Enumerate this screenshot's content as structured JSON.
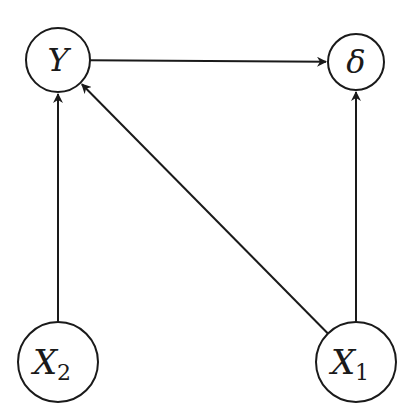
{
  "diagram": {
    "type": "directed-graph",
    "nodes": [
      {
        "id": "Y",
        "label": "Y",
        "subscript": "",
        "cx": 58,
        "cy": 60,
        "r": 32
      },
      {
        "id": "delta",
        "label": "δ",
        "subscript": "",
        "cx": 356,
        "cy": 62,
        "r": 28
      },
      {
        "id": "X2",
        "label": "X",
        "subscript": "2",
        "cx": 58,
        "cy": 362,
        "r": 40
      },
      {
        "id": "X1",
        "label": "X",
        "subscript": "1",
        "cx": 356,
        "cy": 362,
        "r": 40
      }
    ],
    "edges": [
      {
        "from": "Y",
        "to": "delta"
      },
      {
        "from": "X2",
        "to": "Y"
      },
      {
        "from": "X1",
        "to": "Y"
      },
      {
        "from": "X1",
        "to": "delta"
      }
    ]
  }
}
